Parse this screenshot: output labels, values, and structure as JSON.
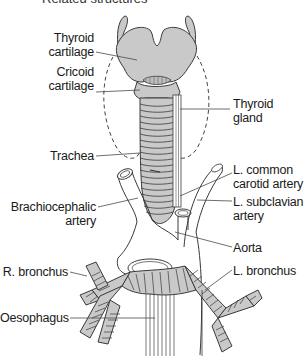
{
  "figure": {
    "title_partial": "Related structures",
    "colors": {
      "cartilage_fill": "#c9c9c9",
      "outline": "#3a3a3a",
      "leader": "#4a4a4a",
      "text": "#1a1a1a",
      "background": "#ffffff"
    }
  },
  "labels": {
    "thyroid_cartilage": [
      "Thyroid",
      "cartilage"
    ],
    "cricoid_cartilage": [
      "Cricoid",
      "cartilage"
    ],
    "thyroid_gland": [
      "Thyroid",
      "gland"
    ],
    "trachea": [
      "Trachea"
    ],
    "l_common_carotid": [
      "L. common",
      "carotid artery"
    ],
    "brachiocephalic": [
      "Brachiocephalic",
      "artery"
    ],
    "l_subclavian": [
      "L. subclavian",
      "artery"
    ],
    "aorta": [
      "Aorta"
    ],
    "r_bronchus": [
      "R. bronchus"
    ],
    "l_bronchus": [
      "L. bronchus"
    ],
    "oesophagus": [
      "Oesophagus"
    ]
  }
}
